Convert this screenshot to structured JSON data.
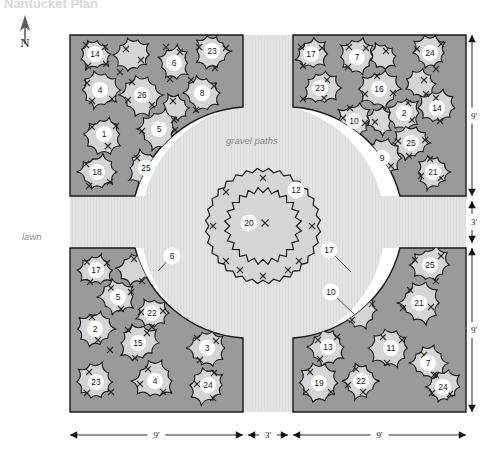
{
  "title": "Nantucket Plan",
  "labels": {
    "north": "N",
    "lawn": "lawn",
    "gravel": "gravel paths"
  },
  "colors": {
    "lawn": "#ffffff",
    "gravel": "#e2e2e2",
    "bed_fill": "#9a9a9a",
    "plant_fill": "#d5d5d5",
    "outline": "#1a1a1a",
    "key_bg": "#ffffff",
    "key_text": "#1a1a1a",
    "dim_line": "#111111",
    "italic_text": "#8a8a8a"
  },
  "dimensions": {
    "bottom": [
      {
        "text": "9'",
        "x1": 70,
        "x2": 243,
        "y": 435
      },
      {
        "text": "3'",
        "x1": 248,
        "x2": 288,
        "y": 435
      },
      {
        "text": "9'",
        "x1": 293,
        "x2": 466,
        "y": 435
      }
    ],
    "right": [
      {
        "text": "9'",
        "y1": 35,
        "y2": 196,
        "x": 472
      },
      {
        "text": "3'",
        "y1": 201,
        "y2": 243,
        "x": 472
      },
      {
        "text": "9'",
        "y1": 248,
        "y2": 412,
        "x": 472
      }
    ]
  },
  "center": {
    "cx": 263,
    "cy": 226,
    "outer_ring": {
      "r": 56,
      "key": "12",
      "key_x": 296,
      "key_y": 190,
      "marks": [
        [
          263,
          178
        ],
        [
          226,
          192
        ],
        [
          213,
          226
        ],
        [
          226,
          261
        ],
        [
          263,
          276
        ],
        [
          299,
          261
        ],
        [
          312,
          226
        ],
        [
          299,
          192
        ],
        [
          240,
          270
        ],
        [
          288,
          270
        ]
      ]
    },
    "inner_ring": {
      "r": 36,
      "key": "20",
      "key_x": 249,
      "key_y": 223,
      "marks": [
        [
          265,
          223
        ]
      ]
    }
  },
  "beds": [
    {
      "name": "bed-northwest",
      "plants": [
        {
          "key": "14",
          "cx": 95,
          "cy": 54,
          "r": 17,
          "marks": [
            [
              86,
              45
            ],
            [
              105,
              47
            ],
            [
              88,
              66
            ],
            [
              106,
              64
            ]
          ]
        },
        {
          "key": "",
          "cx": 133,
          "cy": 55,
          "r": 19,
          "marks": [
            [
              126,
              49
            ],
            [
              141,
              60
            ],
            [
              120,
              72
            ]
          ]
        },
        {
          "key": "6",
          "cx": 174,
          "cy": 63,
          "r": 17,
          "marks": [
            [
              166,
              47
            ],
            [
              180,
              52
            ],
            [
              170,
              79
            ]
          ]
        },
        {
          "key": "23",
          "cx": 212,
          "cy": 51,
          "r": 18,
          "marks": [
            [
              199,
              47
            ],
            [
              226,
              48
            ],
            [
              215,
              68
            ]
          ]
        },
        {
          "key": "4",
          "cx": 100,
          "cy": 90,
          "r": 19,
          "marks": [
            [
              87,
              83
            ],
            [
              92,
              101
            ],
            [
              112,
              99
            ]
          ]
        },
        {
          "key": "26",
          "cx": 142,
          "cy": 95,
          "r": 21,
          "marks": [
            [
              132,
              82
            ],
            [
              128,
              100
            ],
            [
              152,
              105
            ]
          ]
        },
        {
          "key": "8",
          "cx": 202,
          "cy": 93,
          "r": 19,
          "marks": [
            [
              191,
              80
            ],
            [
              214,
              86
            ],
            [
              196,
              110
            ]
          ]
        },
        {
          "key": "",
          "cx": 176,
          "cy": 108,
          "r": 15,
          "marks": [
            [
              173,
              101
            ],
            [
              174,
              120
            ]
          ]
        },
        {
          "key": "1",
          "cx": 104,
          "cy": 134,
          "r": 19,
          "marks": [
            [
              92,
              127
            ],
            [
              116,
              126
            ],
            [
              108,
              146
            ]
          ]
        },
        {
          "key": "5",
          "cx": 159,
          "cy": 129,
          "r": 20,
          "marks": [
            [
              142,
              131
            ],
            [
              175,
              130
            ]
          ]
        },
        {
          "key": "18",
          "cx": 97,
          "cy": 172,
          "r": 18,
          "marks": [
            [
              86,
              164
            ],
            [
              89,
              186
            ],
            [
              110,
              182
            ]
          ]
        },
        {
          "key": "25",
          "cx": 146,
          "cy": 168,
          "r": 19,
          "marks": [
            [
              137,
              158
            ],
            [
              157,
              157
            ],
            [
              141,
              184
            ]
          ]
        }
      ]
    },
    {
      "name": "bed-northeast",
      "plants": [
        {
          "key": "17",
          "cx": 311,
          "cy": 54,
          "r": 17,
          "marks": [
            [
              301,
              47
            ],
            [
              322,
              48
            ],
            [
              303,
              66
            ]
          ]
        },
        {
          "key": "7",
          "cx": 357,
          "cy": 57,
          "r": 18,
          "marks": [
            [
              366,
              48
            ],
            [
              349,
              47
            ],
            [
              348,
              67
            ]
          ]
        },
        {
          "key": "",
          "cx": 383,
          "cy": 56,
          "r": 15,
          "marks": [
            [
              386,
              51
            ]
          ]
        },
        {
          "key": "24",
          "cx": 430,
          "cy": 53,
          "r": 18,
          "marks": [
            [
              417,
              49
            ],
            [
              441,
              44
            ],
            [
              436,
              69
            ]
          ]
        },
        {
          "key": "23",
          "cx": 320,
          "cy": 88,
          "r": 19,
          "marks": [
            [
              327,
              80
            ],
            [
              324,
              98
            ],
            [
              303,
              99
            ]
          ]
        },
        {
          "key": "16",
          "cx": 379,
          "cy": 89,
          "r": 21,
          "marks": [
            [
              377,
              76
            ],
            [
              365,
              94
            ],
            [
              393,
              93
            ]
          ]
        },
        {
          "key": "",
          "cx": 420,
          "cy": 84,
          "r": 16,
          "marks": [
            [
              424,
              80
            ],
            [
              426,
              94
            ]
          ]
        },
        {
          "key": "14",
          "cx": 437,
          "cy": 108,
          "r": 19,
          "marks": [
            [
              436,
              98
            ],
            [
              440,
              121
            ]
          ]
        },
        {
          "key": "2",
          "cx": 404,
          "cy": 113,
          "r": 17,
          "marks": [
            [
              408,
              103
            ],
            [
              412,
              120
            ]
          ]
        },
        {
          "key": "10",
          "cx": 354,
          "cy": 121,
          "r": 19,
          "marks": [
            [
              343,
              118
            ],
            [
              365,
              123
            ],
            [
              350,
              108
            ]
          ]
        },
        {
          "key": "",
          "cx": 380,
          "cy": 121,
          "r": 14,
          "marks": [
            [
              375,
              122
            ]
          ]
        },
        {
          "key": "25",
          "cx": 411,
          "cy": 143,
          "r": 18,
          "marks": [
            [
              398,
              141
            ],
            [
              425,
              140
            ],
            [
              409,
              156
            ]
          ]
        },
        {
          "key": "9",
          "cx": 382,
          "cy": 158,
          "r": 19,
          "marks": [
            [
              372,
              146
            ],
            [
              377,
              172
            ],
            [
              391,
              166
            ]
          ]
        },
        {
          "key": "21",
          "cx": 433,
          "cy": 172,
          "r": 18,
          "marks": [
            [
              430,
              159
            ],
            [
              421,
              176
            ],
            [
              441,
              178
            ]
          ]
        }
      ]
    },
    {
      "name": "bed-southwest",
      "plants": [
        {
          "key": "17",
          "cx": 96,
          "cy": 270,
          "r": 18,
          "marks": [
            [
              87,
              262
            ],
            [
              107,
              263
            ],
            [
              90,
              282
            ]
          ]
        },
        {
          "key": "",
          "cx": 136,
          "cy": 268,
          "r": 19,
          "marks": [
            [
              134,
              259
            ],
            [
              142,
              281
            ]
          ]
        },
        {
          "key": "5",
          "cx": 118,
          "cy": 297,
          "r": 19,
          "marks": [
            [
              111,
              288
            ],
            [
              121,
              309
            ],
            [
              131,
              292
            ]
          ]
        },
        {
          "key": "2",
          "cx": 95,
          "cy": 329,
          "r": 19,
          "marks": [
            [
              92,
              317
            ],
            [
              98,
              340
            ],
            [
              110,
              350
            ]
          ]
        },
        {
          "key": "22",
          "cx": 152,
          "cy": 313,
          "r": 16,
          "marks": [
            [
              141,
              312
            ],
            [
              163,
              311
            ],
            [
              152,
              327
            ]
          ]
        },
        {
          "key": "15",
          "cx": 138,
          "cy": 343,
          "r": 21,
          "marks": [
            [
              128,
              330
            ],
            [
              147,
              333
            ],
            [
              135,
              358
            ]
          ]
        },
        {
          "key": "3",
          "cx": 207,
          "cy": 348,
          "r": 19,
          "marks": [
            [
              197,
              338
            ],
            [
              216,
              341
            ],
            [
              200,
              360
            ]
          ]
        },
        {
          "key": "23",
          "cx": 96,
          "cy": 382,
          "r": 19,
          "marks": [
            [
              89,
              372
            ],
            [
              87,
              393
            ],
            [
              111,
              392
            ]
          ]
        },
        {
          "key": "4",
          "cx": 155,
          "cy": 381,
          "r": 21,
          "marks": [
            [
              148,
              369
            ],
            [
              140,
              384
            ],
            [
              163,
              392
            ]
          ]
        },
        {
          "key": "24",
          "cx": 208,
          "cy": 385,
          "r": 19,
          "marks": [
            [
              214,
              373
            ],
            [
              197,
              384
            ],
            [
              213,
              398
            ]
          ]
        }
      ],
      "callouts": [
        {
          "key": "6",
          "x": 172,
          "y": 256,
          "lx": 158,
          "ly": 271
        }
      ]
    },
    {
      "name": "bed-southeast",
      "plants": [
        {
          "key": "",
          "cx": 350,
          "cy": 270,
          "r": 19,
          "marks": [
            [
              348,
              258
            ],
            [
              345,
              283
            ]
          ]
        },
        {
          "key": "25",
          "cx": 430,
          "cy": 265,
          "r": 19,
          "marks": [
            [
              415,
              260
            ],
            [
              441,
              256
            ],
            [
              436,
              281
            ]
          ]
        },
        {
          "key": "21",
          "cx": 419,
          "cy": 303,
          "r": 21,
          "marks": [
            [
              410,
              290
            ],
            [
              403,
              308
            ],
            [
              431,
              307
            ]
          ]
        },
        {
          "key": "",
          "cx": 360,
          "cy": 310,
          "r": 19,
          "marks": [
            [
              357,
              303
            ],
            [
              372,
              304
            ],
            [
              352,
              320
            ]
          ]
        },
        {
          "key": "13",
          "cx": 328,
          "cy": 347,
          "r": 19,
          "marks": [
            [
              318,
              340
            ],
            [
              337,
              337
            ],
            [
              320,
              359
            ]
          ]
        },
        {
          "key": "11",
          "cx": 391,
          "cy": 348,
          "r": 21,
          "marks": [
            [
              383,
              337
            ],
            [
              402,
              340
            ],
            [
              387,
              363
            ]
          ]
        },
        {
          "key": "7",
          "cx": 428,
          "cy": 363,
          "r": 18,
          "marks": [
            [
              424,
              355
            ],
            [
              434,
              375
            ]
          ]
        },
        {
          "key": "22",
          "cx": 361,
          "cy": 381,
          "r": 18,
          "marks": [
            [
              356,
              369
            ],
            [
              363,
              392
            ],
            [
              348,
              385
            ]
          ]
        },
        {
          "key": "19",
          "cx": 319,
          "cy": 383,
          "r": 19,
          "marks": [
            [
              310,
              372
            ],
            [
              306,
              392
            ],
            [
              331,
              392
            ]
          ]
        },
        {
          "key": "24",
          "cx": 443,
          "cy": 387,
          "r": 18,
          "marks": [
            [
              436,
              375
            ],
            [
              432,
              393
            ],
            [
              450,
              394
            ]
          ]
        }
      ],
      "callouts": [
        {
          "key": "17",
          "x": 329,
          "y": 250,
          "lx": 351,
          "ly": 272
        },
        {
          "key": "10",
          "x": 331,
          "y": 292,
          "lx": 355,
          "ly": 315
        }
      ]
    }
  ]
}
